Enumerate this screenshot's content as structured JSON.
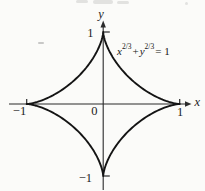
{
  "figure": {
    "background": "#fbfbf9",
    "ink_color": "#161616",
    "axis_color": "#2b2b2b"
  },
  "equation": {
    "var_x": "x",
    "var_y": "y",
    "exponent": "2/3",
    "plus": "+",
    "equals": "= 1"
  },
  "axes": {
    "x_label": "x",
    "y_label": "y",
    "origin_label": "0",
    "x_ticks": [
      {
        "value": -1,
        "label": "−1"
      },
      {
        "value": 1,
        "label": "1"
      }
    ],
    "y_ticks": [
      {
        "value": 1,
        "label": "1"
      },
      {
        "value": -1,
        "label": "−1"
      }
    ]
  },
  "chart_data": {
    "type": "line",
    "title": "",
    "curve": {
      "name": "astroid",
      "equation": "x^(2/3) + y^(2/3) = 1",
      "parametric_x": "cos^3(t)",
      "parametric_y": "sin^3(t)",
      "power": 3,
      "t_range": [
        0,
        6.2832
      ],
      "cusps": [
        [
          1,
          0
        ],
        [
          0,
          1
        ],
        [
          -1,
          0
        ],
        [
          0,
          -1
        ]
      ]
    },
    "xlabel": "x",
    "ylabel": "y",
    "xlim": [
      -1.25,
      1.3
    ],
    "ylim": [
      -1.2,
      1.2
    ],
    "x_ticks": [
      -1,
      1
    ],
    "y_ticks": [
      -1,
      1
    ],
    "grid": false,
    "legend": false,
    "annotations": [
      {
        "text": "x^(2/3) + y^(2/3) = 1",
        "position": "upper-right"
      }
    ]
  }
}
